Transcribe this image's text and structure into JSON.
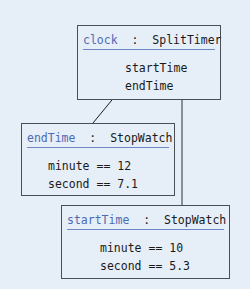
{
  "diagram": {
    "type": "object-diagram",
    "colors": {
      "background": "#e6eef8",
      "border": "#4a4f57",
      "object_name": "#4d6bb3",
      "underline": "#6f86c4",
      "text": "#1a1a1a"
    },
    "objects": [
      {
        "id": "clock",
        "name": "clock",
        "separator": ":",
        "type": "SplitTimer",
        "fields": [
          "startTime",
          "endTime"
        ]
      },
      {
        "id": "endTime",
        "name": "endTime",
        "separator": ":",
        "type": "StopWatch",
        "fields": [
          "minute == 12",
          "second == 7.1"
        ]
      },
      {
        "id": "startTime",
        "name": "startTime",
        "separator": ":",
        "type": "StopWatch",
        "fields": [
          "minute == 10",
          "second == 5.3"
        ]
      }
    ],
    "links": [
      {
        "from": "clock.endTime",
        "to": "endTime",
        "marker": "square"
      },
      {
        "from": "clock.startTime",
        "to": "startTime",
        "marker": "diamond"
      }
    ]
  }
}
